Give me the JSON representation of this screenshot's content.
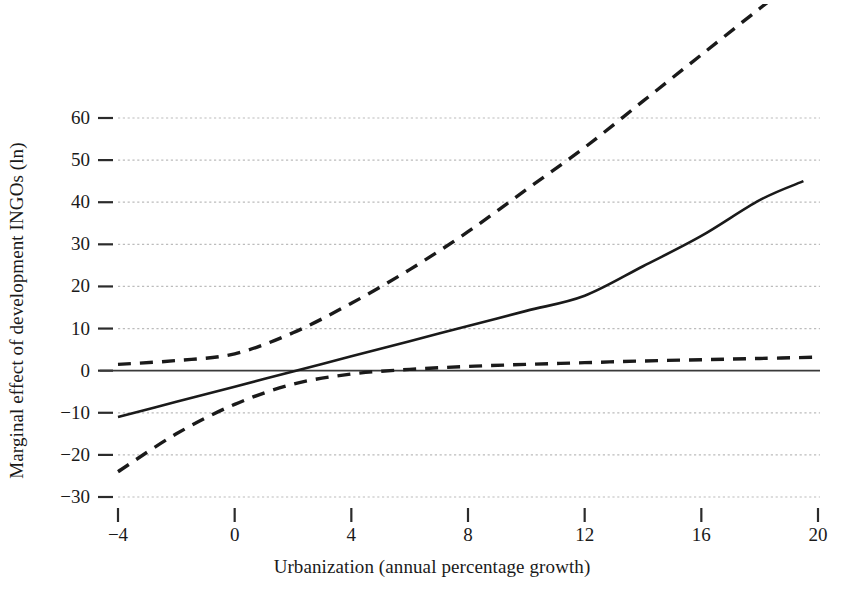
{
  "chart_data": {
    "type": "line",
    "title": "",
    "xlabel": "Urbanization (annual percentage growth)",
    "ylabel": "Marginal effect of development INGOs (ln)",
    "xlim": [
      -4,
      20
    ],
    "ylim": [
      -30,
      62
    ],
    "xticks": [
      -4,
      0,
      4,
      8,
      12,
      16,
      20
    ],
    "xtick_labels": [
      "−4",
      "0",
      "4",
      "8",
      "12",
      "16",
      "20"
    ],
    "yticks": [
      60,
      50,
      40,
      30,
      20,
      10,
      0,
      -10,
      -20,
      -30
    ],
    "ytick_labels": [
      "60",
      "50",
      "40",
      "30",
      "20",
      "10",
      "0",
      "−10",
      "−20",
      "−30"
    ],
    "grid": "horizontal-dotted",
    "legend": "none",
    "zero_reference_line": 0,
    "series": [
      {
        "name": "Marginal effect",
        "style": "solid",
        "color": "#1a1a1a",
        "x": [
          -4,
          -2,
          0,
          2,
          4,
          6,
          8,
          10,
          12,
          14,
          16,
          18,
          19.5
        ],
        "values": [
          -11.0,
          -7.4,
          -3.8,
          -0.2,
          3.4,
          7.0,
          10.6,
          14.2,
          17.8,
          24.8,
          32.0,
          40.5,
          45.0
        ]
      },
      {
        "name": "Upper 95% confidence bound",
        "style": "dashed",
        "color": "#1a1a1a",
        "x": [
          -4,
          -2,
          0,
          2,
          4,
          6,
          8,
          10,
          12,
          14,
          16,
          18,
          19.5
        ],
        "values": [
          1.5,
          2.4,
          4.0,
          9.0,
          16.0,
          24.0,
          33.0,
          43.0,
          53.0,
          64.0,
          75.0,
          86.0,
          94.0
        ]
      },
      {
        "name": "Lower 95% confidence bound",
        "style": "dashed",
        "color": "#1a1a1a",
        "x": [
          -4,
          -2,
          0,
          2,
          4,
          6,
          8,
          10,
          12,
          14,
          16,
          18,
          20
        ],
        "values": [
          -24.0,
          -15.0,
          -8.0,
          -3.2,
          -0.8,
          0.3,
          1.0,
          1.5,
          1.9,
          2.3,
          2.6,
          2.9,
          3.2
        ]
      }
    ],
    "zero_crossing_x": 0.85
  },
  "geometry": {
    "plot_left": 118,
    "plot_right": 818,
    "plot_top": 118,
    "plot_bottom": 497
  }
}
